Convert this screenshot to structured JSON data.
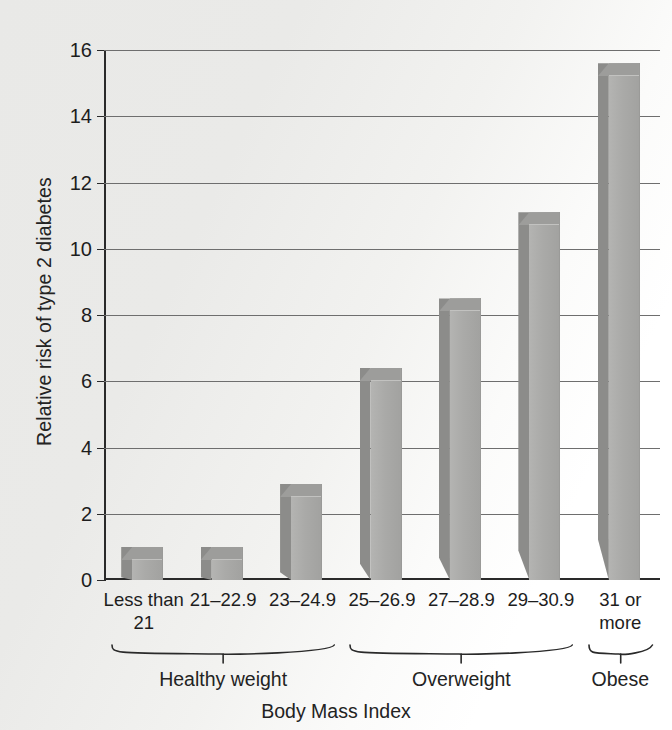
{
  "chart_data": {
    "type": "bar",
    "title": "",
    "xlabel": "Body Mass Index",
    "ylabel": "Relative risk of type 2 diabetes",
    "categories": [
      "Less than\n21",
      "21–22.9",
      "23–24.9",
      "25–26.9",
      "27–28.9",
      "29–30.9",
      "31 or\nmore"
    ],
    "values": [
      1.0,
      1.0,
      2.9,
      6.4,
      8.5,
      11.1,
      15.6
    ],
    "ylim": [
      0,
      16
    ],
    "yticks": [
      0,
      2,
      4,
      6,
      8,
      10,
      12,
      14,
      16
    ],
    "ytick_labels": [
      "0",
      "2",
      "4",
      "6",
      "8",
      "10",
      "12",
      "14",
      "16"
    ],
    "grid": true,
    "legend": "none",
    "groups": [
      {
        "label": "Healthy weight",
        "from": 0,
        "to": 2
      },
      {
        "label": "Overweight",
        "from": 3,
        "to": 5
      },
      {
        "label": "Obese",
        "from": 6,
        "to": 6
      }
    ]
  },
  "style": {
    "bar_face_color": "#aaaaa8",
    "bar_side_color": "#8c8c8a",
    "bar_top_color": "#9d9d9b",
    "gridline_color": "#6e6e6e",
    "axis_color": "#2a2a2a",
    "background_color": "#eaeae8",
    "text_color": "#1d1d1d"
  }
}
